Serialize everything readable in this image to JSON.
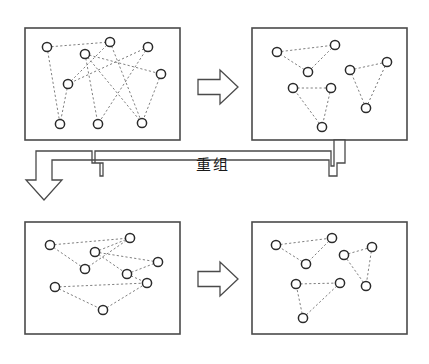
{
  "figure": {
    "title": "",
    "process_label": "重组",
    "background_color": "#ffffff",
    "panel_border_color": "#4a4a4a",
    "node_fill_color": "#ffffff",
    "node_stroke_color": "#2b2b2b",
    "edge_color": "#808080",
    "arrow_stroke_color": "#4a4a4a",
    "node_radius": 4.6
  },
  "panels": [
    {
      "id": "panel-top-left",
      "name": "tangled-graph-before-top",
      "x": 25,
      "y": 28,
      "width": 155,
      "height": 112,
      "nodes": [
        {
          "id": "a1",
          "x": 47,
          "y": 47
        },
        {
          "id": "a2",
          "x": 85,
          "y": 54
        },
        {
          "id": "a3",
          "x": 110,
          "y": 42
        },
        {
          "id": "a4",
          "x": 148,
          "y": 47
        },
        {
          "id": "a5",
          "x": 68,
          "y": 84
        },
        {
          "id": "a6",
          "x": 161,
          "y": 74
        },
        {
          "id": "a7",
          "x": 60,
          "y": 124
        },
        {
          "id": "a8",
          "x": 98,
          "y": 124
        },
        {
          "id": "a9",
          "x": 142,
          "y": 123
        }
      ],
      "edges": [
        [
          "a1",
          "a3"
        ],
        [
          "a1",
          "a7"
        ],
        [
          "a2",
          "a6"
        ],
        [
          "a2",
          "a8"
        ],
        [
          "a3",
          "a5"
        ],
        [
          "a3",
          "a9"
        ],
        [
          "a4",
          "a5"
        ],
        [
          "a4",
          "a8"
        ],
        [
          "a5",
          "a7"
        ],
        [
          "a6",
          "a9"
        ],
        [
          "a2",
          "a9"
        ]
      ]
    },
    {
      "id": "panel-top-right",
      "name": "clustered-graph-after-top",
      "x": 252,
      "y": 28,
      "width": 155,
      "height": 112,
      "nodes": [
        {
          "id": "b1",
          "x": 277,
          "y": 52
        },
        {
          "id": "b2",
          "x": 335,
          "y": 45
        },
        {
          "id": "b3",
          "x": 308,
          "y": 72
        },
        {
          "id": "b4",
          "x": 350,
          "y": 70
        },
        {
          "id": "b5",
          "x": 387,
          "y": 62
        },
        {
          "id": "b6",
          "x": 366,
          "y": 108
        },
        {
          "id": "b7",
          "x": 293,
          "y": 88
        },
        {
          "id": "b8",
          "x": 331,
          "y": 88
        },
        {
          "id": "b9",
          "x": 322,
          "y": 127
        }
      ],
      "edges": [
        [
          "b1",
          "b2"
        ],
        [
          "b2",
          "b3"
        ],
        [
          "b3",
          "b1"
        ],
        [
          "b4",
          "b5"
        ],
        [
          "b5",
          "b6"
        ],
        [
          "b6",
          "b4"
        ],
        [
          "b7",
          "b8"
        ],
        [
          "b8",
          "b9"
        ],
        [
          "b9",
          "b7"
        ]
      ]
    },
    {
      "id": "panel-bottom-left",
      "name": "tangled-graph-before-bottom",
      "x": 25,
      "y": 222,
      "width": 155,
      "height": 112,
      "nodes": [
        {
          "id": "c1",
          "x": 50,
          "y": 245
        },
        {
          "id": "c2",
          "x": 95,
          "y": 252
        },
        {
          "id": "c3",
          "x": 130,
          "y": 238
        },
        {
          "id": "c4",
          "x": 85,
          "y": 269
        },
        {
          "id": "c5",
          "x": 158,
          "y": 262
        },
        {
          "id": "c6",
          "x": 127,
          "y": 274
        },
        {
          "id": "c7",
          "x": 147,
          "y": 283
        },
        {
          "id": "c8",
          "x": 55,
          "y": 287
        },
        {
          "id": "c9",
          "x": 103,
          "y": 310
        }
      ],
      "edges": [
        [
          "c1",
          "c3"
        ],
        [
          "c1",
          "c4"
        ],
        [
          "c2",
          "c3"
        ],
        [
          "c2",
          "c6"
        ],
        [
          "c3",
          "c4"
        ],
        [
          "c2",
          "c5"
        ],
        [
          "c5",
          "c6"
        ],
        [
          "c6",
          "c7"
        ],
        [
          "c8",
          "c7"
        ],
        [
          "c8",
          "c9"
        ],
        [
          "c9",
          "c7"
        ]
      ]
    },
    {
      "id": "panel-bottom-right",
      "name": "clustered-graph-after-bottom",
      "x": 252,
      "y": 222,
      "width": 155,
      "height": 112,
      "nodes": [
        {
          "id": "d1",
          "x": 276,
          "y": 245
        },
        {
          "id": "d2",
          "x": 332,
          "y": 238
        },
        {
          "id": "d3",
          "x": 306,
          "y": 264
        },
        {
          "id": "d4",
          "x": 344,
          "y": 255
        },
        {
          "id": "d5",
          "x": 372,
          "y": 247
        },
        {
          "id": "d6",
          "x": 366,
          "y": 286
        },
        {
          "id": "d7",
          "x": 296,
          "y": 284
        },
        {
          "id": "d8",
          "x": 340,
          "y": 283
        },
        {
          "id": "d9",
          "x": 303,
          "y": 318
        }
      ],
      "edges": [
        [
          "d1",
          "d2"
        ],
        [
          "d2",
          "d3"
        ],
        [
          "d3",
          "d1"
        ],
        [
          "d4",
          "d5"
        ],
        [
          "d5",
          "d6"
        ],
        [
          "d6",
          "d4"
        ],
        [
          "d7",
          "d8"
        ],
        [
          "d8",
          "d9"
        ],
        [
          "d9",
          "d7"
        ]
      ]
    }
  ],
  "arrows": [
    {
      "id": "arrow-top",
      "name": "transform-arrow-top",
      "direction": "right",
      "x": 198,
      "y": 70,
      "width": 40,
      "height": 34
    },
    {
      "id": "arrow-bottom",
      "name": "transform-arrow-bottom",
      "direction": "right",
      "x": 198,
      "y": 262,
      "width": 40,
      "height": 34
    },
    {
      "id": "arrow-feedback",
      "name": "recombine-feedback-arrow",
      "direction": "down-left-routed",
      "from_panel": "panel-top-right",
      "to_panel": "panel-bottom-left"
    }
  ]
}
